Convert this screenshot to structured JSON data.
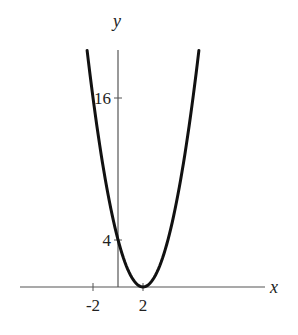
{
  "chart_data": {
    "type": "line",
    "title": "",
    "function": "y = (x - 2)^2",
    "xlabel": "x",
    "ylabel": "y",
    "x_ticks": [
      -2,
      2
    ],
    "x_tick_labels": [
      "-2",
      "2"
    ],
    "y_ticks": [
      4,
      16
    ],
    "y_tick_labels": [
      "4",
      "16"
    ],
    "xlim": [
      -7.8,
      11.8
    ],
    "ylim": [
      0,
      20
    ],
    "grid": false,
    "legend": "none",
    "series": [
      {
        "name": "parabola",
        "x": [
          -2.47,
          -2,
          -1,
          0,
          1,
          2,
          3,
          4,
          5,
          6,
          6.47
        ],
        "y": [
          20,
          16,
          9,
          4,
          1,
          0,
          1,
          4,
          9,
          16,
          20
        ]
      }
    ],
    "colors": {
      "axis": "#555555",
      "curve": "#111111",
      "text": "#222222"
    }
  }
}
